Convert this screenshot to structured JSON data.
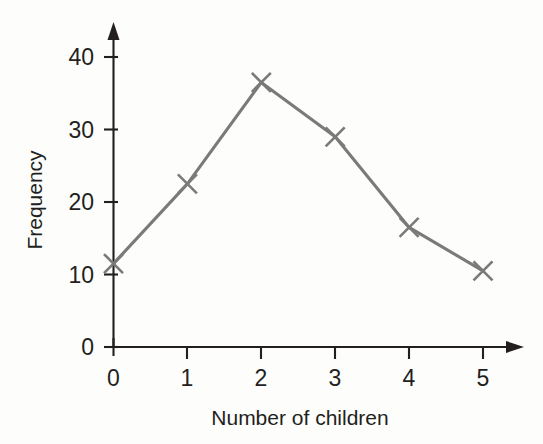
{
  "chart_data": {
    "type": "line",
    "title": "",
    "subtitle": "",
    "xlabel": "Number of children",
    "ylabel": "Frequency",
    "x": [
      0,
      1,
      2,
      3,
      4,
      5
    ],
    "categories": [
      "0",
      "1",
      "2",
      "3",
      "4",
      "5"
    ],
    "values": [
      11.5,
      22.5,
      36.5,
      29,
      16.5,
      10.5
    ],
    "series": [
      {
        "name": "Frequency",
        "values": [
          11.5,
          22.5,
          36.5,
          29,
          16.5,
          10.5
        ],
        "color": "#7a7a7a",
        "marker": "x"
      }
    ],
    "xlim": [
      0,
      5.5
    ],
    "ylim": [
      0,
      43
    ],
    "xticks": [
      0,
      1,
      2,
      3,
      4,
      5
    ],
    "xtick_labels": [
      "0",
      "1",
      "2",
      "3",
      "4",
      "5"
    ],
    "yticks": [
      0,
      10,
      20,
      30,
      40
    ],
    "ytick_labels": [
      "0",
      "10",
      "20",
      "30",
      "40"
    ],
    "grid": false,
    "legend": false,
    "legend_position": "none",
    "axis_color": "#231f20",
    "background_color": "#fdfdfc",
    "x_axis_arrow": true,
    "y_axis_arrow": true,
    "annotations": []
  },
  "axes": {
    "y_tick_labels": [
      "40",
      "30",
      "20",
      "10",
      "0"
    ],
    "x_tick_labels": [
      "0",
      "1",
      "2",
      "3",
      "4",
      "5"
    ],
    "y_title": "Frequency",
    "x_title": "Number of children"
  }
}
